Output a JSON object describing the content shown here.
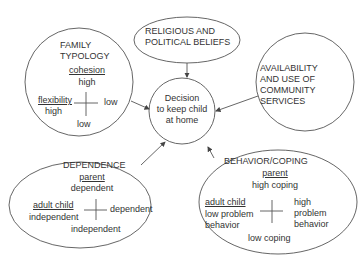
{
  "diagram": {
    "center_node": {
      "lines": [
        "Decision",
        "to keep child",
        "at home"
      ]
    },
    "family_typology": {
      "title": [
        "FAMILY",
        "TYPOLOGY"
      ],
      "top_axis_label": "cohesion",
      "top_value": "high",
      "left_axis_label": "flexibility",
      "left_value": "high",
      "right_value": "low",
      "bottom_value": "low"
    },
    "religious": {
      "lines": [
        "RELIGIOUS AND",
        "POLITICAL BELIEFS"
      ]
    },
    "services": {
      "lines": [
        "AVAILABILITY",
        "AND USE OF",
        "COMMUNITY",
        "SERVICES"
      ]
    },
    "dependence": {
      "title": "DEPENDENCE",
      "top_axis_label": "parent",
      "top_value": "dependent",
      "left_axis_label": "adult child",
      "left_value": "independent",
      "right_value": "dependent",
      "bottom_value": "independent"
    },
    "behavior": {
      "title": "BEHAVIOR/COPING",
      "top_axis_label": "parent",
      "top_value": "high coping",
      "left_axis_label": "adult child",
      "left_value": [
        "low problem",
        "behavior"
      ],
      "right_value": [
        "high",
        "problem",
        "behavior"
      ],
      "bottom_value": "low coping"
    }
  },
  "colors": {
    "stroke": "#555555",
    "text": "#333333"
  }
}
